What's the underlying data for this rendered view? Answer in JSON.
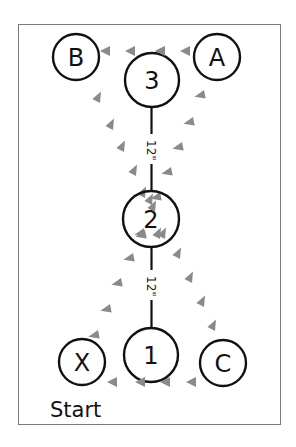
{
  "diagram": {
    "frame": {
      "x": 18,
      "y": 24,
      "width": 263,
      "height": 401,
      "stroke": "#7a7a7a"
    },
    "colors": {
      "line": "#111111",
      "arrow": "#8a8a8a",
      "circle_fill": "#ffffff"
    },
    "nodes": [
      {
        "id": "B",
        "label": "B",
        "cx": 76,
        "cy": 57,
        "r": 23
      },
      {
        "id": "3",
        "label": "3",
        "cx": 152,
        "cy": 80,
        "r": 27
      },
      {
        "id": "A",
        "label": "A",
        "cx": 217,
        "cy": 57,
        "r": 23
      },
      {
        "id": "2",
        "label": "2",
        "cx": 151,
        "cy": 219,
        "r": 28
      },
      {
        "id": "X",
        "label": "X",
        "cx": 82,
        "cy": 362,
        "r": 23
      },
      {
        "id": "1",
        "label": "1",
        "cx": 151,
        "cy": 355,
        "r": 27
      },
      {
        "id": "C",
        "label": "C",
        "cx": 223,
        "cy": 363,
        "r": 23
      }
    ],
    "distances": [
      {
        "from": "3",
        "to": "2",
        "label": "12\""
      },
      {
        "from": "2",
        "to": "1",
        "label": "12\""
      }
    ],
    "paths": [
      {
        "from": "C",
        "to": "X",
        "direction": "left"
      },
      {
        "from": "X",
        "to": "2",
        "direction": "up-right"
      },
      {
        "from": "2",
        "to": "A",
        "direction": "up-right"
      },
      {
        "from": "A",
        "to": "B",
        "direction": "left"
      },
      {
        "from": "B",
        "to": "2",
        "direction": "down-right"
      },
      {
        "from": "2",
        "to": "C",
        "direction": "down-right"
      }
    ],
    "start_label": "Start"
  }
}
